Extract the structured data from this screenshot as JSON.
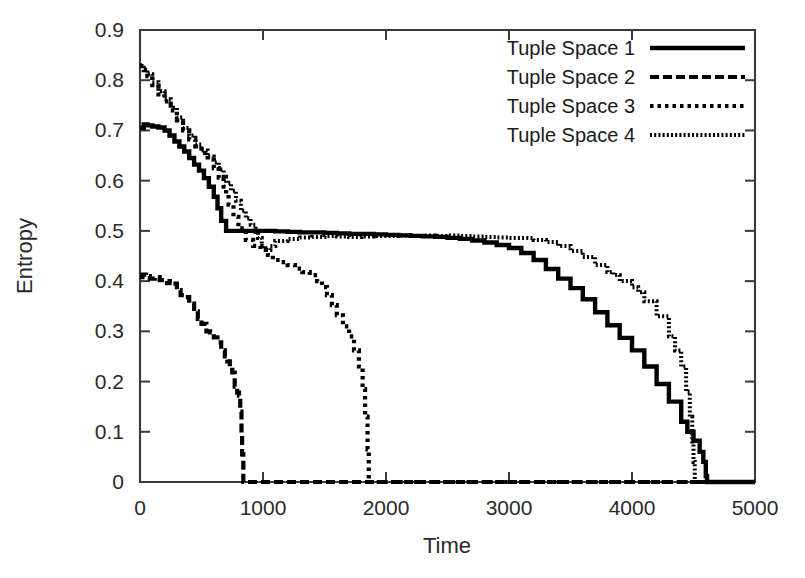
{
  "figure": {
    "background_color": "#ffffff",
    "foreground_color": "#000000"
  },
  "axes": {
    "x_title": "Time",
    "y_title": "Entropy",
    "x_ticks": [
      "0",
      "1000",
      "2000",
      "3000",
      "4000",
      "5000"
    ],
    "y_ticks": [
      "0",
      "0.1",
      "0.2",
      "0.3",
      "0.4",
      "0.5",
      "0.6",
      "0.7",
      "0.8",
      "0.9"
    ]
  },
  "legend": {
    "position": "top-right",
    "entries": [
      {
        "label": "Tuple Space 1",
        "style": "solid"
      },
      {
        "label": "Tuple Space 2",
        "style": "dashed"
      },
      {
        "label": "Tuple Space 3",
        "style": "dotted"
      },
      {
        "label": "Tuple Space 4",
        "style": "fine-dotted"
      }
    ]
  },
  "chart_data": {
    "type": "line",
    "title": "",
    "xlabel": "Time",
    "ylabel": "Entropy",
    "xlim": [
      0,
      5000
    ],
    "ylim": [
      0,
      0.9
    ],
    "xticks": [
      0,
      1000,
      2000,
      3000,
      4000,
      5000
    ],
    "yticks": [
      0,
      0.1,
      0.2,
      0.3,
      0.4,
      0.5,
      0.6,
      0.7,
      0.8,
      0.9
    ],
    "grid": false,
    "legend_position": "upper right",
    "series": [
      {
        "name": "Tuple Space 1",
        "style": "solid",
        "linewidth": 4,
        "x": [
          0,
          30,
          60,
          100,
          150,
          200,
          240,
          280,
          320,
          360,
          400,
          440,
          480,
          520,
          560,
          600,
          630,
          660,
          700,
          800,
          900,
          1000,
          1100,
          1200,
          1300,
          1400,
          1500,
          1600,
          1700,
          1800,
          1900,
          2000,
          2100,
          2200,
          2300,
          2400,
          2500,
          2600,
          2700,
          2800,
          2900,
          3000,
          3100,
          3200,
          3300,
          3400,
          3500,
          3600,
          3700,
          3800,
          3900,
          4000,
          4100,
          4200,
          4300,
          4400,
          4450,
          4500,
          4550,
          4580,
          4600,
          4610,
          5000
        ],
        "y": [
          0.705,
          0.712,
          0.71,
          0.708,
          0.706,
          0.7,
          0.69,
          0.678,
          0.668,
          0.658,
          0.645,
          0.632,
          0.62,
          0.605,
          0.588,
          0.568,
          0.545,
          0.52,
          0.5,
          0.5,
          0.5,
          0.5,
          0.499,
          0.498,
          0.497,
          0.497,
          0.496,
          0.495,
          0.494,
          0.494,
          0.493,
          0.492,
          0.491,
          0.49,
          0.489,
          0.488,
          0.486,
          0.484,
          0.481,
          0.477,
          0.472,
          0.466,
          0.456,
          0.442,
          0.424,
          0.405,
          0.386,
          0.364,
          0.338,
          0.312,
          0.287,
          0.262,
          0.23,
          0.195,
          0.16,
          0.12,
          0.1,
          0.082,
          0.06,
          0.04,
          0.012,
          0.0,
          0.0
        ]
      },
      {
        "name": "Tuple Space 2",
        "style": "dashed",
        "linewidth": 4,
        "x": [
          0,
          20,
          50,
          80,
          120,
          160,
          200,
          240,
          270,
          300,
          330,
          360,
          400,
          440,
          470,
          500,
          540,
          570,
          600,
          630,
          660,
          690,
          710,
          730,
          750,
          770,
          790,
          805,
          815,
          825,
          830,
          840,
          1000,
          2000,
          3000,
          4000,
          5000
        ],
        "y": [
          0.408,
          0.413,
          0.41,
          0.405,
          0.408,
          0.402,
          0.396,
          0.4,
          0.395,
          0.382,
          0.372,
          0.368,
          0.355,
          0.34,
          0.325,
          0.315,
          0.3,
          0.298,
          0.288,
          0.278,
          0.262,
          0.25,
          0.24,
          0.228,
          0.218,
          0.19,
          0.178,
          0.172,
          0.14,
          0.095,
          0.055,
          0.0,
          0.0,
          0.0,
          0.0,
          0.0,
          0.0
        ]
      },
      {
        "name": "Tuple Space 3",
        "style": "dotted",
        "linewidth": 4,
        "x": [
          0,
          30,
          60,
          100,
          150,
          200,
          250,
          300,
          350,
          400,
          450,
          500,
          550,
          600,
          640,
          680,
          700,
          720,
          760,
          800,
          860,
          920,
          980,
          1040,
          1080,
          1140,
          1200,
          1260,
          1320,
          1380,
          1440,
          1480,
          1520,
          1560,
          1600,
          1650,
          1700,
          1740,
          1780,
          1810,
          1830,
          1850,
          1860,
          2000,
          3000,
          4000,
          5000
        ],
        "y": [
          0.828,
          0.82,
          0.808,
          0.79,
          0.772,
          0.758,
          0.74,
          0.72,
          0.7,
          0.682,
          0.668,
          0.655,
          0.642,
          0.625,
          0.606,
          0.588,
          0.572,
          0.552,
          0.528,
          0.505,
          0.482,
          0.47,
          0.462,
          0.452,
          0.442,
          0.438,
          0.432,
          0.425,
          0.418,
          0.412,
          0.4,
          0.388,
          0.372,
          0.352,
          0.332,
          0.31,
          0.29,
          0.262,
          0.23,
          0.185,
          0.13,
          0.065,
          0.0,
          0.0,
          0.0,
          0.0,
          0.0
        ]
      },
      {
        "name": "Tuple Space 4",
        "style": "fine-dotted",
        "linewidth": 4,
        "x": [
          0,
          30,
          60,
          100,
          150,
          200,
          250,
          300,
          350,
          400,
          450,
          500,
          550,
          600,
          640,
          680,
          700,
          740,
          780,
          820,
          860,
          900,
          940,
          960,
          990,
          1020,
          1060,
          1100,
          1200,
          1300,
          1400,
          1500,
          1600,
          1700,
          1800,
          1900,
          2000,
          2100,
          2200,
          2300,
          2400,
          2500,
          2600,
          2700,
          2800,
          2900,
          3000,
          3100,
          3200,
          3300,
          3400,
          3500,
          3600,
          3700,
          3800,
          3850,
          3900,
          4000,
          4050,
          4100,
          4200,
          4300,
          4350,
          4400,
          4440,
          4470,
          4490,
          4500,
          4510,
          5000
        ],
        "y": [
          0.83,
          0.822,
          0.812,
          0.796,
          0.778,
          0.762,
          0.745,
          0.726,
          0.705,
          0.69,
          0.672,
          0.66,
          0.648,
          0.636,
          0.622,
          0.608,
          0.596,
          0.58,
          0.56,
          0.54,
          0.525,
          0.512,
          0.498,
          0.486,
          0.47,
          0.462,
          0.47,
          0.48,
          0.484,
          0.487,
          0.488,
          0.49,
          0.489,
          0.488,
          0.489,
          0.49,
          0.49,
          0.491,
          0.49,
          0.491,
          0.49,
          0.491,
          0.49,
          0.489,
          0.488,
          0.487,
          0.486,
          0.486,
          0.482,
          0.478,
          0.47,
          0.46,
          0.448,
          0.432,
          0.418,
          0.412,
          0.4,
          0.388,
          0.378,
          0.36,
          0.33,
          0.29,
          0.262,
          0.23,
          0.18,
          0.13,
          0.075,
          0.04,
          0.0,
          0.0
        ]
      }
    ]
  }
}
